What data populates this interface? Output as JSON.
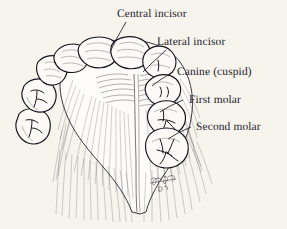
{
  "figure": {
    "kind": "anatomical-illustration",
    "medium": "pen and ink line drawing",
    "background_color": "#f7f4ee",
    "ink_color": "#1d1d26"
  },
  "labels": [
    {
      "id": "central-incisor",
      "text": "Central incisor"
    },
    {
      "id": "lateral-incisor",
      "text": "Lateral incisor"
    },
    {
      "id": "canine-cuspid",
      "text": "Canine (cuspid)"
    },
    {
      "id": "first-molar",
      "text": "First molar"
    },
    {
      "id": "second-molar",
      "text": "Second molar"
    }
  ],
  "signature": {
    "artist_mark": "",
    "year": ""
  }
}
